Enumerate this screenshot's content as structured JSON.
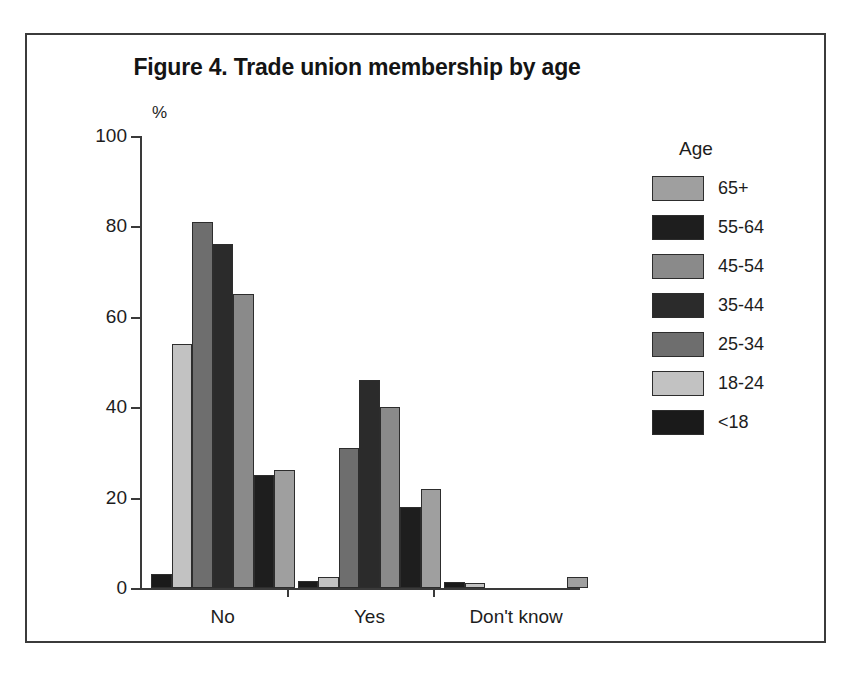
{
  "figure": {
    "title": "Figure 4. Trade union membership by age",
    "y_axis_unit": "%",
    "legend_title": "Age"
  },
  "chart_data": {
    "type": "bar",
    "title": "Figure 4. Trade union membership by age",
    "xlabel": "",
    "ylabel": "%",
    "ylim": [
      0,
      100
    ],
    "yticks": [
      0,
      20,
      40,
      60,
      80,
      100
    ],
    "grid": false,
    "legend_position": "right",
    "legend_title": "Age",
    "categories": [
      "No",
      "Yes",
      "Don't know"
    ],
    "series": [
      {
        "name": "65+",
        "color": "#9f9f9f",
        "values": [
          26,
          22,
          2.5
        ]
      },
      {
        "name": "55-64",
        "color": "#1e1e1e",
        "values": [
          25,
          18,
          0
        ]
      },
      {
        "name": "45-54",
        "color": "#8a8a8a",
        "values": [
          65,
          40,
          0
        ]
      },
      {
        "name": "35-44",
        "color": "#2b2b2b",
        "values": [
          76,
          46,
          0
        ]
      },
      {
        "name": "25-34",
        "color": "#6e6e6e",
        "values": [
          81,
          31,
          0
        ]
      },
      {
        "name": "18-24",
        "color": "#c2c2c2",
        "values": [
          54,
          2.5,
          1.2
        ]
      },
      {
        "name": "<18",
        "color": "#1a1a1a",
        "values": [
          3.2,
          1.5,
          1.3
        ]
      }
    ],
    "bar_draw_order": [
      "<18",
      "18-24",
      "25-34",
      "35-44",
      "45-54",
      "55-64",
      "65+"
    ]
  }
}
